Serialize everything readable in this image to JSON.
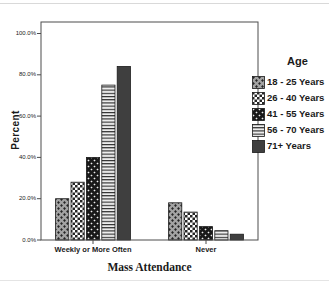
{
  "chart_data": {
    "type": "bar",
    "title": "",
    "xlabel": "Mass Attendance",
    "ylabel": "Percent",
    "categories": [
      "Weekly or More Often",
      "Never"
    ],
    "series": [
      {
        "name": "18 - 25 Years",
        "pattern": "gray-diamond",
        "values": [
          20.0,
          18.0
        ]
      },
      {
        "name": "26 - 40 Years",
        "pattern": "white-check",
        "values": [
          28.0,
          13.5
        ]
      },
      {
        "name": "41 - 55 Years",
        "pattern": "black-diamond",
        "values": [
          40.0,
          6.5
        ]
      },
      {
        "name": "56 - 70 Years",
        "pattern": "horizontal-lines",
        "values": [
          75.0,
          4.5
        ]
      },
      {
        "name": "71+ Years",
        "pattern": "solid-dark",
        "values": [
          84.0,
          2.8
        ]
      }
    ],
    "ylim": [
      0,
      100
    ],
    "yticks": [
      {
        "value": 0,
        "label": "0.0%"
      },
      {
        "value": 20,
        "label": "20.0%"
      },
      {
        "value": 40,
        "label": "40.0%"
      },
      {
        "value": 60,
        "label": "60.0%"
      },
      {
        "value": 80,
        "label": "80.0%"
      },
      {
        "value": 100,
        "label": "100.0%"
      }
    ],
    "legend_title": "Age",
    "legend_position": "right",
    "grid": false
  },
  "colors": {
    "background": "#ffffff",
    "text": "#1a1a1a",
    "frame": "#4d4d4d",
    "bar_outline": "#1a1a1a",
    "gray_fill": "#a3a3a3",
    "near_black": "#191919",
    "dark_fill": "#3f3f3f",
    "light_fill": "#ededed",
    "pattern_dark": "#262626",
    "pattern_light": "#ededed",
    "check_background": "#ffffff"
  }
}
